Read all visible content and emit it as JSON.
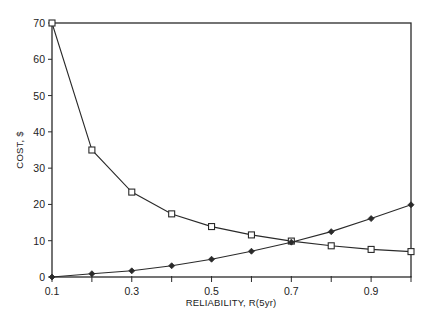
{
  "chart_data": {
    "type": "line",
    "title": "",
    "xlabel": "RELIABILITY, R(5yr)",
    "ylabel": "COST, $",
    "xlim": [
      0.1,
      1.0
    ],
    "ylim": [
      0,
      70
    ],
    "grid": false,
    "legend": null,
    "x": [
      0.1,
      0.2,
      0.3,
      0.4,
      0.5,
      0.6,
      0.7,
      0.8,
      0.9,
      1.0
    ],
    "x_tick_labels": [
      "0.1",
      "0.3",
      "0.5",
      "0.7",
      "0.9"
    ],
    "x_tick_values": [
      0.1,
      0.2,
      0.3,
      0.4,
      0.5,
      0.6,
      0.7,
      0.8,
      0.9,
      1.0
    ],
    "y_tick_labels": [
      "0",
      "10",
      "20",
      "30",
      "40",
      "50",
      "60",
      "70"
    ],
    "y_tick_values": [
      0,
      10,
      20,
      30,
      40,
      50,
      60,
      70
    ],
    "series": [
      {
        "name": "square-marker series (decreasing)",
        "marker": "square",
        "values": [
          70,
          35,
          23.4,
          17.4,
          13.9,
          11.6,
          9.9,
          8.6,
          7.6,
          7.0
        ]
      },
      {
        "name": "diamond-marker series (increasing)",
        "marker": "diamond",
        "values": [
          0,
          0.9,
          1.7,
          3.1,
          4.9,
          7.1,
          9.6,
          12.5,
          16.1,
          19.9
        ]
      }
    ]
  }
}
